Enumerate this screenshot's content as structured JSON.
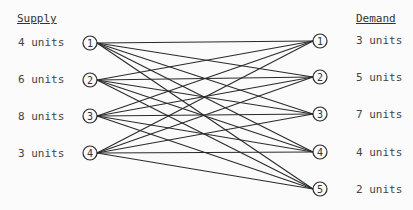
{
  "supply": {
    "header": "Supply",
    "nodes": [
      {
        "id": "1",
        "label": "4 units"
      },
      {
        "id": "2",
        "label": "6 units"
      },
      {
        "id": "3",
        "label": "8 units"
      },
      {
        "id": "4",
        "label": "3 units"
      }
    ]
  },
  "demand": {
    "header": "Demand",
    "nodes": [
      {
        "id": "1",
        "label": "3 units"
      },
      {
        "id": "2",
        "label": "5 units"
      },
      {
        "id": "3",
        "label": "7 units"
      },
      {
        "id": "4",
        "label": "4 units"
      },
      {
        "id": "5",
        "label": "2 units"
      }
    ]
  },
  "edges": "complete bipartite: every supply node connects to every demand node"
}
